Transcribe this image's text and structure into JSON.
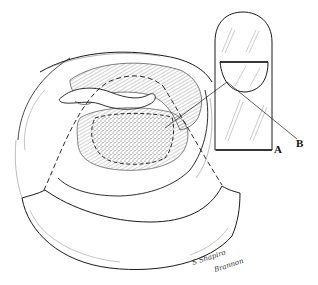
{
  "figure": {
    "type": "anatomical line illustration",
    "background": "#ffffff",
    "ink_color": "#1a1a1a",
    "stipple_color": "#555555"
  },
  "labels": {
    "a": "A",
    "b": "B"
  },
  "signature": {
    "line1": "S Shapiro",
    "line2": "Brannon"
  },
  "inset": {
    "name": "finger-dorsal-view",
    "description": "fingertip with nail plate; lunula-shaped region outlined"
  },
  "main_view": {
    "name": "nail-bed-exposure",
    "description": "retracted nail fold with stippled oval graft area outlined by dashed line; dashed curved incision lines"
  }
}
